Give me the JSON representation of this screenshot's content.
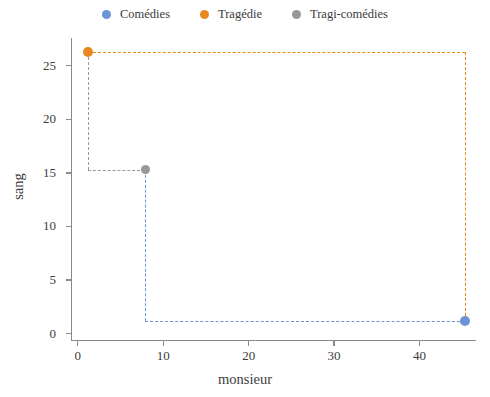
{
  "chart_data": {
    "type": "scatter",
    "title": "",
    "xlabel": "monsieur",
    "ylabel": "sang",
    "xlim": [
      -0.8,
      46.5
    ],
    "ylim": [
      -0.6,
      27.6
    ],
    "xticks": [
      "0",
      "10",
      "20",
      "30",
      "40"
    ],
    "xtick_values": [
      0,
      10,
      20,
      30,
      40
    ],
    "yticks": [
      "0",
      "5",
      "10",
      "15",
      "20",
      "25"
    ],
    "ytick_values": [
      0,
      5,
      10,
      15,
      20,
      25
    ],
    "grid": false,
    "legend_position": "top-center",
    "series": [
      {
        "name": "Comédies",
        "color": "#6b93d6",
        "x": 45.3,
        "y": 1.2,
        "guide": "elbow-vertical-then-horizontal"
      },
      {
        "name": "Tragédie",
        "color": "#e8871e",
        "x": 1.2,
        "y": 26.3,
        "guide": "elbow-horizontal-then-vertical"
      },
      {
        "name": "Tragi-comédies",
        "color": "#989898",
        "x": 7.9,
        "y": 15.3,
        "guide": "elbow-horizontal-then-vertical"
      }
    ]
  },
  "legend": {
    "entries": [
      {
        "label": "Comédies",
        "color": "#6b93d6",
        "marker": "circle-marker-comedies"
      },
      {
        "label": "Tragédie",
        "color": "#e8871e",
        "marker": "circle-marker-tragedie"
      },
      {
        "label": "Tragi-comédies",
        "color": "#989898",
        "marker": "circle-marker-tragi-comedies"
      }
    ]
  },
  "axes": {
    "x_title": "monsieur",
    "y_title": "sang",
    "x_tick_labels": [
      "0",
      "10",
      "20",
      "30",
      "40"
    ],
    "y_tick_labels": [
      "0",
      "5",
      "10",
      "15",
      "20",
      "25"
    ]
  },
  "colors": {
    "blue": "#6b93d6",
    "orange": "#e8871e",
    "gray": "#989898",
    "axis": "#8a8a8a",
    "text": "#3c3c3c",
    "background": "#ffffff"
  }
}
